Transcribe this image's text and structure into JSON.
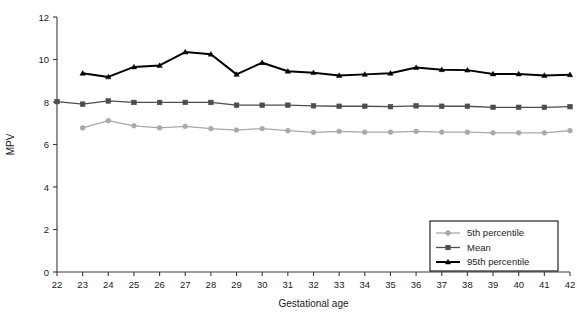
{
  "chart_data": {
    "type": "line",
    "title": "",
    "xlabel": "Gestational age",
    "ylabel": "MPV",
    "xlim": [
      22,
      42
    ],
    "ylim": [
      0,
      12
    ],
    "grid": false,
    "legend_position": "bottom-right",
    "x": [
      22,
      23,
      24,
      25,
      26,
      27,
      28,
      29,
      30,
      31,
      32,
      33,
      34,
      35,
      36,
      37,
      38,
      39,
      40,
      41,
      42
    ],
    "y_ticks": [
      0,
      2,
      4,
      6,
      8,
      10,
      12
    ],
    "x_ticks": [
      22,
      23,
      24,
      25,
      26,
      27,
      28,
      29,
      30,
      31,
      32,
      33,
      34,
      35,
      36,
      37,
      38,
      39,
      40,
      41,
      42
    ],
    "series": [
      {
        "name": "5th percentile",
        "color": "#a8a8a8",
        "marker": "circle",
        "x": [
          23,
          24,
          25,
          26,
          27,
          28,
          29,
          30,
          31,
          32,
          33,
          34,
          35,
          36,
          37,
          38,
          39,
          40,
          41,
          42
        ],
        "values": [
          6.78,
          7.12,
          6.88,
          6.78,
          6.85,
          6.75,
          6.68,
          6.75,
          6.65,
          6.57,
          6.62,
          6.58,
          6.58,
          6.62,
          6.58,
          6.58,
          6.55,
          6.55,
          6.55,
          6.65
        ]
      },
      {
        "name": "Mean",
        "color": "#4d4d4d",
        "marker": "square",
        "x": [
          22,
          23,
          24,
          25,
          26,
          27,
          28,
          29,
          30,
          31,
          32,
          33,
          34,
          35,
          36,
          37,
          38,
          39,
          40,
          41,
          42
        ],
        "values": [
          8.02,
          7.9,
          8.05,
          7.98,
          7.98,
          7.98,
          7.98,
          7.85,
          7.85,
          7.85,
          7.82,
          7.8,
          7.8,
          7.78,
          7.82,
          7.8,
          7.8,
          7.75,
          7.75,
          7.75,
          7.78
        ]
      },
      {
        "name": "95th percentile",
        "color": "#000000",
        "marker": "triangle",
        "x": [
          23,
          24,
          25,
          26,
          27,
          28,
          29,
          30,
          31,
          32,
          33,
          34,
          35,
          36,
          37,
          38,
          39,
          40,
          41,
          42
        ],
        "values": [
          9.35,
          9.18,
          9.65,
          9.72,
          10.35,
          10.25,
          9.3,
          9.85,
          9.45,
          9.38,
          9.25,
          9.3,
          9.35,
          9.62,
          9.52,
          9.5,
          9.32,
          9.32,
          9.25,
          9.28
        ]
      }
    ]
  },
  "legend": {
    "items": [
      {
        "label": "5th percentile"
      },
      {
        "label": "Mean"
      },
      {
        "label": "95th percentile"
      }
    ]
  }
}
